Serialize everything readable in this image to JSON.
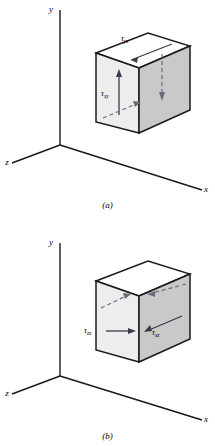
{
  "figure": {
    "colors": {
      "line": "#1a1a1a",
      "face_top": "#ffffff",
      "face_front": "#eeeeee",
      "face_right": "#c9c9c9",
      "arrow_solid": "#3a3a4a",
      "arrow_dashed": "#6a6a7a"
    },
    "panels": [
      {
        "id": "a",
        "caption": "(a)",
        "axes": [
          {
            "name": "y-axis",
            "label": "y"
          },
          {
            "name": "x-axis",
            "label": "x"
          },
          {
            "name": "z-axis",
            "label": "z"
          }
        ],
        "stress_labels": [
          {
            "name": "tau-yz",
            "symbol": "τ",
            "subscript": "yz"
          },
          {
            "name": "tau-xy",
            "symbol": "τ",
            "subscript": "xy"
          }
        ],
        "arrows": [
          {
            "name": "arrow-top-forward",
            "style": "solid",
            "direction": "down-left"
          },
          {
            "name": "arrow-front-up",
            "style": "solid",
            "direction": "up"
          },
          {
            "name": "arrow-right-down",
            "style": "dashed",
            "direction": "down"
          },
          {
            "name": "arrow-bottom-back",
            "style": "dashed",
            "direction": "up-right"
          }
        ]
      },
      {
        "id": "b",
        "caption": "(b)",
        "axes": [
          {
            "name": "y-axis",
            "label": "y"
          },
          {
            "name": "x-axis",
            "label": "x"
          },
          {
            "name": "z-axis",
            "label": "z"
          }
        ],
        "stress_labels": [
          {
            "name": "tau-zx",
            "symbol": "τ",
            "subscript": "zx"
          },
          {
            "name": "tau-xz",
            "symbol": "τ",
            "subscript": "xz"
          }
        ],
        "arrows": [
          {
            "name": "arrow-front-right",
            "style": "solid",
            "direction": "right"
          },
          {
            "name": "arrow-right-left",
            "style": "solid",
            "direction": "left"
          },
          {
            "name": "arrow-top-back-right",
            "style": "dashed",
            "direction": "up-right"
          },
          {
            "name": "arrow-top-back-left",
            "style": "dashed",
            "direction": "left"
          }
        ]
      }
    ]
  }
}
